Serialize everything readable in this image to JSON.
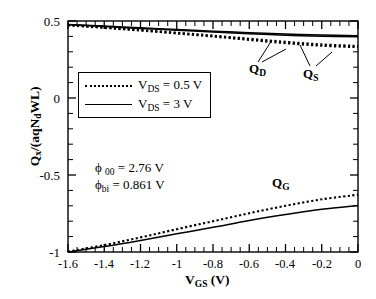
{
  "chart_data": {
    "type": "line",
    "title": "",
    "xlabel": "V_GS (V)",
    "ylabel": "Q_x/(aqN_d WL)",
    "xlim": [
      -1.6,
      0.0
    ],
    "ylim": [
      -1.0,
      0.5
    ],
    "xticks": [
      -1.6,
      -1.4,
      -1.2,
      -1.0,
      -0.8,
      -0.6,
      -0.4,
      -0.2,
      0
    ],
    "xtick_labels": [
      "-1.6",
      "-1.4",
      "-1.2",
      "-1",
      "-0.8",
      "-0.6",
      "-0.4",
      "-0.2",
      "0"
    ],
    "yticks": [
      0.5,
      0.0,
      -0.5,
      -1.0
    ],
    "ytick_labels": [
      "0.5",
      "0",
      "-0.5",
      "-1"
    ],
    "grid": false,
    "minor_ticks": true,
    "legend_position": "upper-left-inside",
    "series": [
      {
        "name": "Q_D (V_DS = 0.5 V)",
        "style": "dotted",
        "x": [
          -1.6,
          -1.4,
          -1.2,
          -1.0,
          -0.8,
          -0.6,
          -0.4,
          -0.2,
          0.0
        ],
        "y": [
          0.472,
          0.455,
          0.438,
          0.419,
          0.399,
          0.377,
          0.356,
          0.339,
          0.33
        ]
      },
      {
        "name": "Q_S (V_DS = 0.5 V)",
        "style": "dotted",
        "x": [
          -1.6,
          -1.4,
          -1.2,
          -1.0,
          -0.8,
          -0.6,
          -0.4,
          -0.2,
          0.0
        ],
        "y": [
          0.474,
          0.458,
          0.442,
          0.424,
          0.405,
          0.385,
          0.365,
          0.348,
          0.338
        ]
      },
      {
        "name": "Q_D (V_DS = 3 V)",
        "style": "solid",
        "x": [
          -1.6,
          -1.4,
          -1.2,
          -1.0,
          -0.8,
          -0.6,
          -0.4,
          -0.2,
          0.0
        ],
        "y": [
          0.476,
          0.464,
          0.452,
          0.44,
          0.428,
          0.417,
          0.408,
          0.401,
          0.397
        ]
      },
      {
        "name": "Q_S (V_DS = 3 V)",
        "style": "solid",
        "x": [
          -1.6,
          -1.4,
          -1.2,
          -1.0,
          -0.8,
          -0.6,
          -0.4,
          -0.2,
          0.0
        ],
        "y": [
          0.478,
          0.467,
          0.456,
          0.445,
          0.434,
          0.424,
          0.415,
          0.409,
          0.405
        ]
      },
      {
        "name": "Q_G (V_DS = 0.5 V)",
        "style": "dotted",
        "x": [
          -1.6,
          -1.4,
          -1.2,
          -1.0,
          -0.8,
          -0.6,
          -0.4,
          -0.2,
          0.0
        ],
        "y": [
          -0.998,
          -0.955,
          -0.905,
          -0.852,
          -0.8,
          -0.748,
          -0.7,
          -0.658,
          -0.628
        ]
      },
      {
        "name": "Q_G (V_DS = 3 V)",
        "style": "solid",
        "x": [
          -1.6,
          -1.4,
          -1.2,
          -1.0,
          -0.8,
          -0.6,
          -0.4,
          -0.2,
          0.0
        ],
        "y": [
          -1.0,
          -0.965,
          -0.925,
          -0.882,
          -0.84,
          -0.796,
          -0.757,
          -0.722,
          -0.698
        ]
      }
    ],
    "annotations": [
      {
        "name": "phi-00",
        "text": "φ 00 = 2.76 V",
        "x": -1.15,
        "y": -0.33
      },
      {
        "name": "phi-bi",
        "text": "φbi = 0.861 V",
        "x": -1.15,
        "y": -0.42
      },
      {
        "name": "QD",
        "text": "QD",
        "x": -0.44,
        "y": 0.325
      },
      {
        "name": "QS",
        "text": "QS",
        "x": -0.2,
        "y": 0.305
      },
      {
        "name": "QG",
        "text": "QG",
        "x": -0.36,
        "y": -0.45
      }
    ]
  },
  "axes": {
    "y_label_main": "Q",
    "y_label_sub": "x",
    "y_label_rest": "/(aqN",
    "y_label_sub2": "d",
    "y_label_tail": "WL)",
    "x_label_main": "V",
    "x_label_sub": "GS",
    "x_label_unit": "(V)",
    "ytick_labels": [
      "0.5",
      "0",
      "-0.5",
      "-1"
    ],
    "xtick_labels": [
      "-1.6",
      "-1.4",
      "-1.2",
      "-1",
      "-0.8",
      "-0.6",
      "-0.4",
      "-0.2",
      "0"
    ]
  },
  "legend": {
    "entries": [
      {
        "style": "dotted",
        "symbol": "V",
        "subscript": "DS",
        "value": "= 0.5 V"
      },
      {
        "style": "solid",
        "symbol": "V",
        "subscript": "DS",
        "value": "= 3 V"
      }
    ]
  },
  "curve_labels": {
    "qd_main": "Q",
    "qd_sub": "D",
    "qs_main": "Q",
    "qs_sub": "S",
    "qg_main": "Q",
    "qg_sub": "G"
  },
  "annotations": {
    "phi_symbol": "ϕ",
    "phi00_sub": "00",
    "phi00_value": "= 2.76 V",
    "phibi_sub": "bi",
    "phibi_value": "= 0.861 V"
  }
}
